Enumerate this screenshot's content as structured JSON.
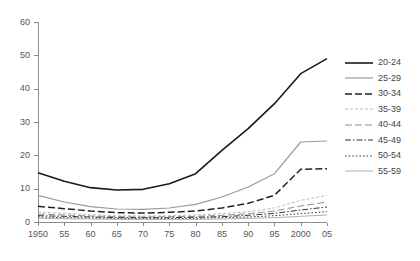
{
  "chart_data": {
    "type": "line",
    "title": "",
    "xlabel": "",
    "ylabel": "",
    "xlim": [
      1950,
      2005
    ],
    "ylim": [
      0,
      60
    ],
    "grid": false,
    "legend_position": "right",
    "x": [
      1950,
      1955,
      1960,
      1965,
      1970,
      1975,
      1980,
      1985,
      1990,
      1995,
      2000,
      2005
    ],
    "xtick_labels": [
      "1950",
      "55",
      "60",
      "65",
      "70",
      "75",
      "80",
      "85",
      "90",
      "95",
      "2000",
      "05"
    ],
    "ytick_labels": [
      "0",
      "10",
      "20",
      "30",
      "40",
      "50",
      "60"
    ],
    "ytick_values": [
      0,
      10,
      20,
      30,
      40,
      50,
      60
    ],
    "series": [
      {
        "name": "20-24",
        "style": "solid",
        "color": "#1a1a1a",
        "width": 1.6,
        "values": [
          14.8,
          12.2,
          10.3,
          9.6,
          9.8,
          11.5,
          14.5,
          21.5,
          28.0,
          35.5,
          44.5,
          49.0
        ]
      },
      {
        "name": "25-29",
        "style": "solid",
        "color": "#9a9a9a",
        "width": 1.2,
        "values": [
          8.0,
          6.0,
          4.6,
          3.9,
          3.8,
          4.2,
          5.3,
          7.5,
          10.5,
          14.5,
          24.0,
          24.3
        ]
      },
      {
        "name": "30-34",
        "style": "dashed",
        "color": "#222222",
        "width": 1.5,
        "values": [
          4.7,
          4.0,
          3.3,
          2.8,
          2.7,
          2.9,
          3.3,
          4.2,
          5.6,
          8.0,
          15.8,
          16.0
        ]
      },
      {
        "name": "35-39",
        "style": "fine-dash",
        "color": "#b5b5b5",
        "width": 0.9,
        "values": [
          3.0,
          2.6,
          2.2,
          1.9,
          1.8,
          1.9,
          2.1,
          2.5,
          3.1,
          4.2,
          6.5,
          8.0
        ]
      },
      {
        "name": "40-44",
        "style": "dashed",
        "color": "#8f8f8f",
        "width": 1.0,
        "values": [
          2.4,
          2.1,
          1.8,
          1.6,
          1.5,
          1.6,
          1.7,
          2.0,
          2.5,
          3.3,
          4.8,
          6.0
        ]
      },
      {
        "name": "45-49",
        "style": "dash-dot",
        "color": "#333333",
        "width": 1.0,
        "values": [
          1.9,
          1.7,
          1.5,
          1.3,
          1.3,
          1.3,
          1.4,
          1.6,
          2.0,
          2.6,
          3.6,
          4.5
        ]
      },
      {
        "name": "50-54",
        "style": "dotted",
        "color": "#3a3a3a",
        "width": 1.0,
        "values": [
          1.5,
          1.3,
          1.2,
          1.1,
          1.0,
          1.0,
          1.1,
          1.3,
          1.5,
          1.9,
          2.5,
          3.1
        ]
      },
      {
        "name": "55-59",
        "style": "solid",
        "color": "#a8a8a8",
        "width": 0.9,
        "values": [
          1.1,
          1.0,
          0.9,
          0.8,
          0.8,
          0.8,
          0.8,
          0.9,
          1.1,
          1.3,
          1.7,
          2.1
        ]
      }
    ]
  }
}
